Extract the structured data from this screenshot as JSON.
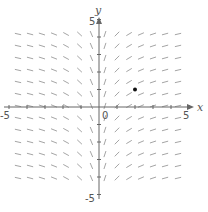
{
  "chart_data": {
    "type": "slope_field",
    "title": "",
    "xlabel": "x",
    "ylabel": "y",
    "xlim": [
      -5,
      5
    ],
    "ylim": [
      -5,
      5
    ],
    "tick_labels": {
      "x_min": "-5",
      "x_max": "5",
      "y_min": "-5",
      "y_max": "5",
      "origin": "0"
    },
    "x_ticks": [
      -5,
      -4,
      -3,
      -2,
      -1,
      0,
      1,
      2,
      3,
      4,
      5
    ],
    "y_ticks": [
      -5,
      -4,
      -3,
      -2,
      -1,
      0,
      1,
      2,
      3,
      4,
      5
    ],
    "grid": false,
    "slope_description": "Slope depends only on x: steep near x=0 (negative for x<0, positive for x>0), flattening toward 0 as |x| grows (resembles dy/dx = 1/x).",
    "segment_columns_x": [
      -4.5,
      -3.83,
      -3.17,
      -2.5,
      -1.83,
      -1.08,
      -0.42,
      0.33,
      1.0,
      1.67,
      2.33,
      3.0,
      3.67,
      4.39
    ],
    "segment_rows_y": [
      4.17,
      3.49,
      2.8,
      2.11,
      1.43,
      0.74,
      0.06,
      -0.63,
      -1.31,
      -2.0,
      -2.69,
      -3.37,
      -4.06
    ],
    "highlight_point": {
      "x": 2.0,
      "y": 1.0,
      "color": "#111111"
    },
    "colors": {
      "segments": "#9a9a9a",
      "axes": "#666666",
      "point": "#111111"
    }
  }
}
